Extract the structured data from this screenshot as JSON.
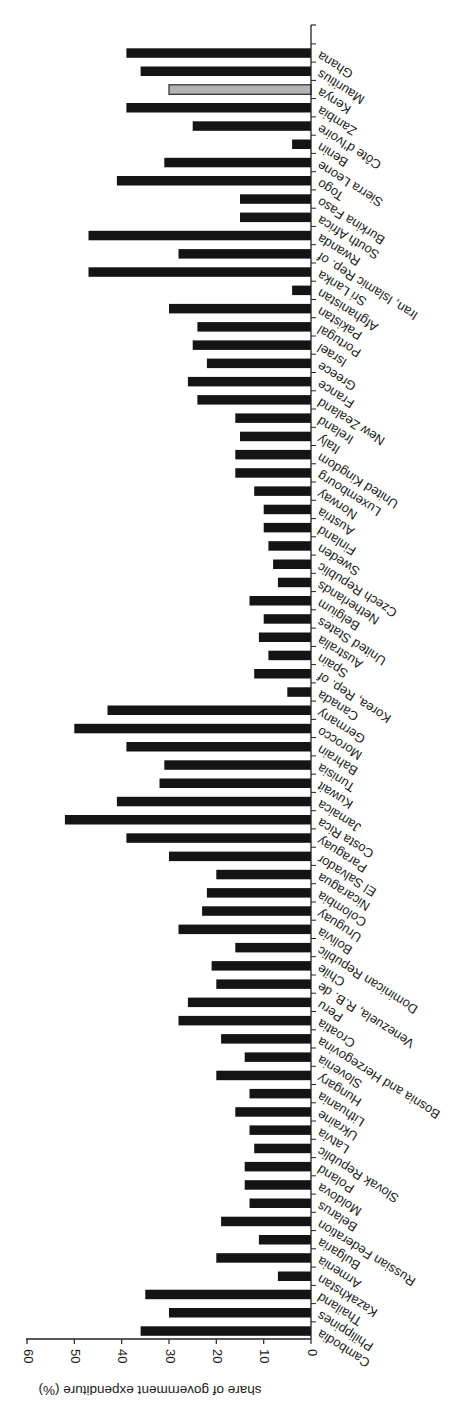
{
  "chart_data": {
    "type": "bar",
    "orientation": "horizontal bars, figure rotated (upside-down text)",
    "title": "",
    "xlabel": "",
    "ylabel": "share of government expenditure (%)",
    "ylim": [
      0,
      60
    ],
    "yticks": [
      0,
      10,
      20,
      30,
      40,
      50,
      60
    ],
    "grid": false,
    "legend": null,
    "highlight_color": "#b3b3b3",
    "bar_color": "#141414",
    "highlighted_category": "Kenya",
    "categories": [
      "Cambodia",
      "Philippines",
      "Thailand",
      "Kazakhstan",
      "Armenia",
      "Bulgaria",
      "Russian Federation",
      "Belarus",
      "Moldova",
      "Poland",
      "Slovak Republic",
      "Latvia",
      "Ukraine",
      "Lithuania",
      "Hungary",
      "Slovenia",
      "Bosnia and Herzegovina",
      "Croatia",
      "Peru",
      "Venezuela, R.B. de",
      "Chile",
      "Dominican Republic",
      "Bolivia",
      "Uruguay",
      "Colombia",
      "Nicaragua",
      "El Salvador",
      "Paraguay",
      "Costa Rica",
      "Jamaica",
      "Kuwait",
      "Tunisia",
      "Bahrain",
      "Morocco",
      "Germany",
      "Canada",
      "Korea, Rep. of",
      "Spain",
      "Australia",
      "United States",
      "Belgium",
      "Netherlands",
      "Czech Republic",
      "Sweden",
      "Finland",
      "Austria",
      "Norway",
      "Luxembourg",
      "United Kingdom",
      "Italy",
      "Ireland",
      "New Zealand",
      "France",
      "Greece",
      "Israel",
      "Portugal",
      "Pakistan",
      "Afghanistan",
      "Sri Lanka",
      "Iran, Islamic Rep. of",
      "Rwanda",
      "South Africa",
      "Burkina Faso",
      "Togo",
      "Sierra Leone",
      "Benin",
      "Côte d'Ivoire",
      "Zambia",
      "Kenya",
      "Mauritius",
      "Ghana"
    ],
    "values": [
      36,
      30,
      35,
      7,
      20,
      11,
      19,
      13,
      14,
      14,
      12,
      13,
      16,
      13,
      20,
      14,
      19,
      28,
      26,
      20,
      21,
      16,
      28,
      23,
      22,
      20,
      30,
      39,
      52,
      41,
      32,
      31,
      39,
      50,
      43,
      5,
      12,
      9,
      11,
      10,
      13,
      7,
      8,
      9,
      10,
      10,
      12,
      16,
      16,
      15,
      16,
      24,
      26,
      22,
      25,
      24,
      30,
      4,
      47,
      28,
      47,
      15,
      15,
      41,
      31,
      4,
      25,
      39,
      30,
      36,
      39
    ]
  }
}
